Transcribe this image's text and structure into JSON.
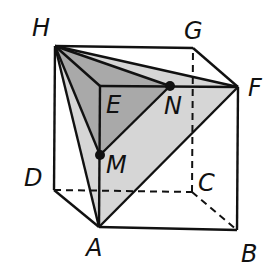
{
  "diagram": {
    "type": "cube-with-sections",
    "colors": {
      "edge": "#111111",
      "light_fill": "#d6d6d6",
      "dark_fill": "#a9a9a9",
      "background": "#ffffff"
    },
    "labels": {
      "H": "H",
      "G": "G",
      "F": "F",
      "E": "E",
      "D": "D",
      "C": "C",
      "B": "B",
      "A": "A",
      "M": "M",
      "N": "N"
    },
    "vertices": {
      "H": [
        55,
        46
      ],
      "G": [
        193,
        48
      ],
      "F": [
        238,
        87
      ],
      "E": [
        100,
        86
      ],
      "D": [
        54,
        190
      ],
      "C": [
        192,
        192
      ],
      "B": [
        237,
        230
      ],
      "A": [
        99,
        227
      ],
      "M": [
        100,
        155
      ],
      "N": [
        170,
        86
      ]
    },
    "shaded_regions": [
      {
        "name": "triangle-HAF",
        "points": [
          "H",
          "A",
          "F"
        ],
        "fill": "light"
      },
      {
        "name": "triangle-HMN",
        "points": [
          "H",
          "M",
          "N"
        ],
        "fill": "dark"
      }
    ],
    "hidden_edges": [
      "D-C",
      "C-G",
      "C-B"
    ],
    "points_marked": [
      "M",
      "N"
    ]
  }
}
